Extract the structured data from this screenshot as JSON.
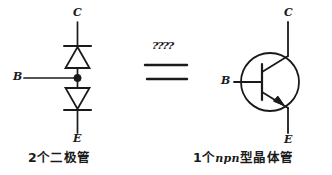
{
  "figure": {
    "type": "hand-drawn-circuit-equivalence-diagram",
    "background_color": "#ffffff",
    "ink_color": "#1a1a1a"
  },
  "left_circuit": {
    "name": "two-diodes-back-to-back",
    "terminals": {
      "collector": "C",
      "base": "B",
      "emitter": "E"
    },
    "caption": "2个二极管",
    "components": [
      {
        "id": "upper-diode",
        "type": "diode",
        "orientation": "pointing-up",
        "cathode": "top"
      },
      {
        "id": "lower-diode",
        "type": "diode",
        "orientation": "pointing-down",
        "cathode": "bottom"
      },
      {
        "id": "base-junction-dot",
        "type": "junction-node"
      }
    ]
  },
  "equivalence": {
    "symbol": "=",
    "annotation": "????"
  },
  "right_circuit": {
    "name": "npn-bipolar-transistor",
    "terminals": {
      "collector": "C",
      "base": "B",
      "emitter": "E"
    },
    "caption_prefix": "1个",
    "caption_latin": "npn",
    "caption_suffix": "型晶体管",
    "caption_full": "1个npn型晶体管",
    "components": [
      {
        "id": "transistor-envelope",
        "type": "circle"
      },
      {
        "id": "base-bar",
        "type": "vertical-bar"
      },
      {
        "id": "collector-lead",
        "type": "angled-lead"
      },
      {
        "id": "emitter-lead-arrow",
        "type": "angled-lead-with-outward-arrow"
      }
    ]
  }
}
